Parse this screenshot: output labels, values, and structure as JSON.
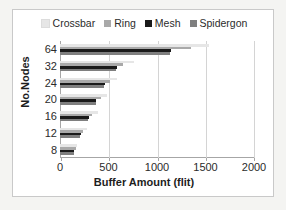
{
  "chart_data": {
    "type": "bar",
    "orientation": "horizontal",
    "title": "",
    "xlabel": "Buffer Amount (flit)",
    "ylabel": "No.Nodes",
    "categories": [
      "64",
      "32",
      "24",
      "20",
      "16",
      "12",
      "8"
    ],
    "xlim": [
      0,
      2000
    ],
    "xticks": [
      0,
      500,
      1000,
      1500,
      2000
    ],
    "xtick_labels": [
      "0",
      "500",
      "1000",
      "1500",
      "2000"
    ],
    "grid": true,
    "legend_position": "top",
    "series": [
      {
        "name": "Crossbar",
        "color": "#e6e6e6",
        "values": [
          1540,
          760,
          590,
          480,
          390,
          280,
          180
        ]
      },
      {
        "name": "Ring",
        "color": "#a9a9a9",
        "values": [
          1350,
          650,
          520,
          420,
          330,
          240,
          160
        ]
      },
      {
        "name": "Mesh",
        "color": "#1a1a1a",
        "values": [
          1140,
          590,
          460,
          375,
          295,
          215,
          145
        ]
      },
      {
        "name": "Spidergon",
        "color": "#7f7f7f",
        "values": [
          1130,
          580,
          455,
          370,
          290,
          210,
          140
        ]
      }
    ]
  },
  "legend": {
    "items": [
      {
        "label": "Crossbar",
        "color": "#e6e6e6"
      },
      {
        "label": "Ring",
        "color": "#a9a9a9"
      },
      {
        "label": "Mesh",
        "color": "#1a1a1a"
      },
      {
        "label": "Spidergon",
        "color": "#7f7f7f"
      }
    ]
  },
  "axes": {
    "y_title": "No.Nodes",
    "x_title": "Buffer Amount (flit)",
    "y_tick_labels": [
      "64",
      "32",
      "24",
      "20",
      "16",
      "12",
      "8"
    ],
    "x_tick_labels": [
      "0",
      "500",
      "1000",
      "1500",
      "2000"
    ]
  }
}
